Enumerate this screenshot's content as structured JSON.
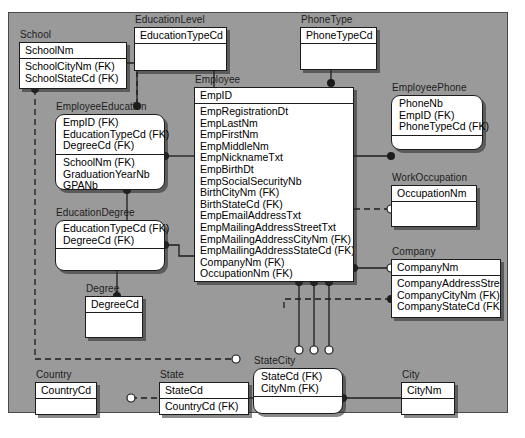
{
  "diagram": {
    "notation": "IDEF1X entity-relationship diagram",
    "canvas_color": "#9a9a9a",
    "entity_fill": "#ffffff",
    "line_color": "#1c1c1c"
  },
  "entities": [
    {
      "id": "school",
      "name": "School",
      "kind": "independent",
      "pk": [
        "SchoolNm"
      ],
      "attributes": [
        "SchoolCityNm (FK)",
        "SchoolStateCd (FK)"
      ]
    },
    {
      "id": "educationlevel",
      "name": "EducationLevel",
      "kind": "independent",
      "pk": [
        "EducationTypeCd"
      ],
      "attributes": []
    },
    {
      "id": "phonetype",
      "name": "PhoneType",
      "kind": "independent",
      "pk": [
        "PhoneTypeCd"
      ],
      "attributes": []
    },
    {
      "id": "employeeeducation",
      "name": "EmployeeEducation",
      "kind": "dependent",
      "pk": [
        "EmpID (FK)",
        "EducationTypeCd (FK)",
        "DegreeCd (FK)"
      ],
      "attributes": [
        "SchoolNm (FK)",
        "GraduationYearNb",
        "GPANb"
      ]
    },
    {
      "id": "employee",
      "name": "Employee",
      "kind": "independent",
      "pk": [
        "EmpID"
      ],
      "attributes": [
        "EmpRegistrationDt",
        "EmpLastNm",
        "EmpFirstNm",
        "EmpMiddleNm",
        "EmpNicknameTxt",
        "EmpBirthDt",
        "EmpSocialSecurityNb",
        "BirthCityNm (FK)",
        "BirthStateCd (FK)",
        "EmpEmailAddressTxt",
        "EmpMailingAddressStreetTxt",
        "EmpMailingAddressCityNm (FK)",
        "EmpMailingAddressStateCd (FK)",
        "CompanyNm (FK)",
        "OccupationNm (FK)"
      ]
    },
    {
      "id": "employeephone",
      "name": "EmployeePhone",
      "kind": "dependent",
      "pk": [
        "PhoneNb",
        "EmpID (FK)",
        "PhoneTypeCd (FK)"
      ],
      "attributes": []
    },
    {
      "id": "workoccupation",
      "name": "WorkOccupation",
      "kind": "independent",
      "pk": [
        "OccupationNm"
      ],
      "attributes": []
    },
    {
      "id": "company",
      "name": "Company",
      "kind": "independent",
      "pk": [
        "CompanyNm"
      ],
      "attributes": [
        "CompanyAddressStreetTxt",
        "CompanyCityNm (FK)",
        "CompanyStateCd (FK)"
      ]
    },
    {
      "id": "educationdegree",
      "name": "EducationDegree",
      "kind": "dependent",
      "pk": [
        "EducationTypeCd (FK)",
        "DegreeCd (FK)"
      ],
      "attributes": []
    },
    {
      "id": "degree",
      "name": "Degree",
      "kind": "independent",
      "pk": [
        "DegreeCd"
      ],
      "attributes": []
    },
    {
      "id": "country",
      "name": "Country",
      "kind": "independent",
      "pk": [
        "CountryCd"
      ],
      "attributes": []
    },
    {
      "id": "state",
      "name": "State",
      "kind": "independent",
      "pk": [
        "StateCd"
      ],
      "attributes": [
        "CountryCd (FK)"
      ]
    },
    {
      "id": "statecity",
      "name": "StateCity",
      "kind": "dependent",
      "pk": [
        "StateCd (FK)",
        "CityNm (FK)"
      ],
      "attributes": []
    },
    {
      "id": "city",
      "name": "City",
      "kind": "independent",
      "pk": [
        "CityNm"
      ],
      "attributes": []
    }
  ],
  "relationships": [
    {
      "from": "School",
      "to": "EmployeeEducation",
      "style": "solid"
    },
    {
      "from": "EducationLevel",
      "to": "EducationDegree",
      "style": "solid"
    },
    {
      "from": "EducationLevel",
      "to": "Employee",
      "style": "solid"
    },
    {
      "from": "PhoneType",
      "to": "EmployeePhone",
      "style": "solid"
    },
    {
      "from": "Employee",
      "to": "EmployeeEducation",
      "style": "solid"
    },
    {
      "from": "Employee",
      "to": "EmployeePhone",
      "style": "solid"
    },
    {
      "from": "Employee",
      "to": "EducationDegree",
      "style": "solid"
    },
    {
      "from": "Employee",
      "to": "WorkOccupation",
      "style": "dashed"
    },
    {
      "from": "Employee",
      "to": "Company",
      "style": "solid"
    },
    {
      "from": "Company",
      "to": "StateCity",
      "style": "dashed"
    },
    {
      "from": "EducationDegree",
      "to": "Degree",
      "style": "solid"
    },
    {
      "from": "School",
      "to": "StateCity",
      "style": "dashed"
    },
    {
      "from": "Country",
      "to": "State",
      "style": "dashed"
    },
    {
      "from": "State",
      "to": "StateCity",
      "style": "solid"
    },
    {
      "from": "City",
      "to": "StateCity",
      "style": "solid"
    },
    {
      "from": "Employee",
      "to": "StateCity",
      "style": "solid",
      "count": 3
    }
  ]
}
